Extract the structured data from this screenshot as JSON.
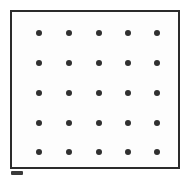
{
  "figure": {
    "title": "Square Dot Grid",
    "canvas_width": 189,
    "canvas_height": 180,
    "background_color": "#ffffff"
  },
  "grid_box": {
    "label": "Grid Border Box",
    "x": 10,
    "y": 10,
    "width": 170,
    "height": 159,
    "border_width": 2,
    "border_color": "#2b2b2b",
    "fill_color": "#fdfdfd"
  },
  "dot_grid": {
    "label": "Dot Grid",
    "rows": 5,
    "columns": 5,
    "total_dots": 25,
    "dot_diameter": 6,
    "dot_color": "#303030",
    "column_x": [
      39,
      69,
      99,
      128,
      157
    ],
    "row_y": [
      33,
      63,
      93,
      123,
      152
    ],
    "column_spacing": 30,
    "row_spacing": 30
  },
  "artifacts": {
    "corner_smudge": {
      "label": "Scan Smudge Mark",
      "x": 11,
      "y": 171,
      "width": 12,
      "height": 4,
      "color": "#3a3a3a"
    }
  },
  "chart_data": {
    "type": "scatter",
    "title": "Square Dot Grid",
    "xlabel": "",
    "ylabel": "",
    "grid": false,
    "legend": "none",
    "xlim": [
      0,
      6
    ],
    "ylim": [
      0,
      6
    ],
    "series": [
      {
        "name": "grid points",
        "marker": "filled-circle",
        "color": "#303030",
        "x": [
          1,
          2,
          3,
          4,
          5,
          1,
          2,
          3,
          4,
          5,
          1,
          2,
          3,
          4,
          5,
          1,
          2,
          3,
          4,
          5,
          1,
          2,
          3,
          4,
          5
        ],
        "y": [
          5,
          5,
          5,
          5,
          5,
          4,
          4,
          4,
          4,
          4,
          3,
          3,
          3,
          3,
          3,
          2,
          2,
          2,
          2,
          2,
          1,
          1,
          1,
          1,
          1
        ]
      }
    ]
  }
}
